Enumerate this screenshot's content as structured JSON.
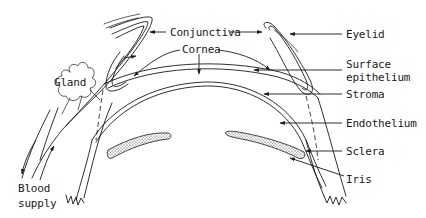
{
  "diagram": {
    "type": "anatomical-cross-section",
    "labels": {
      "conjunctiva": "Conjunctiva",
      "cornea": "Cornea",
      "eyelid": "Eyelid",
      "surface_epithelium_line1": "Surface",
      "surface_epithelium_line2": "epithelium",
      "stroma": "Stroma",
      "endothelium": "Endothelium",
      "sclera": "Sclera",
      "iris": "Iris",
      "gland": "Gland",
      "blood_supply_line1": "Blood",
      "blood_supply_line2": "supply"
    },
    "colors": {
      "ink": "#1a1a1a",
      "background": "#ffffff"
    }
  }
}
